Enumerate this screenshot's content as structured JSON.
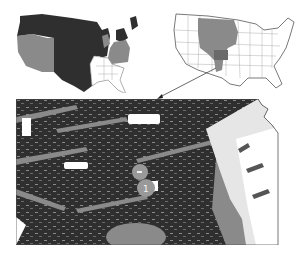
{
  "figure": {
    "panels": [
      {
        "id": "us-regions-map",
        "description": "US map shaded by region in grayscale"
      },
      {
        "id": "us-great-plains-map",
        "description": "US state map with Great Plains region highlighted"
      },
      {
        "id": "kansas-landcover-map",
        "description": "Kansas land-cover map, enlarged"
      }
    ],
    "colors": {
      "dark": "#2f2f2f",
      "mid": "#8a8a8a",
      "light": "#c8c8c8",
      "white": "#ffffff",
      "outline": "#555555"
    },
    "markers": [
      {
        "label": "",
        "x": 140,
        "y": 172
      },
      {
        "label": "1",
        "x": 146,
        "y": 188
      }
    ]
  }
}
